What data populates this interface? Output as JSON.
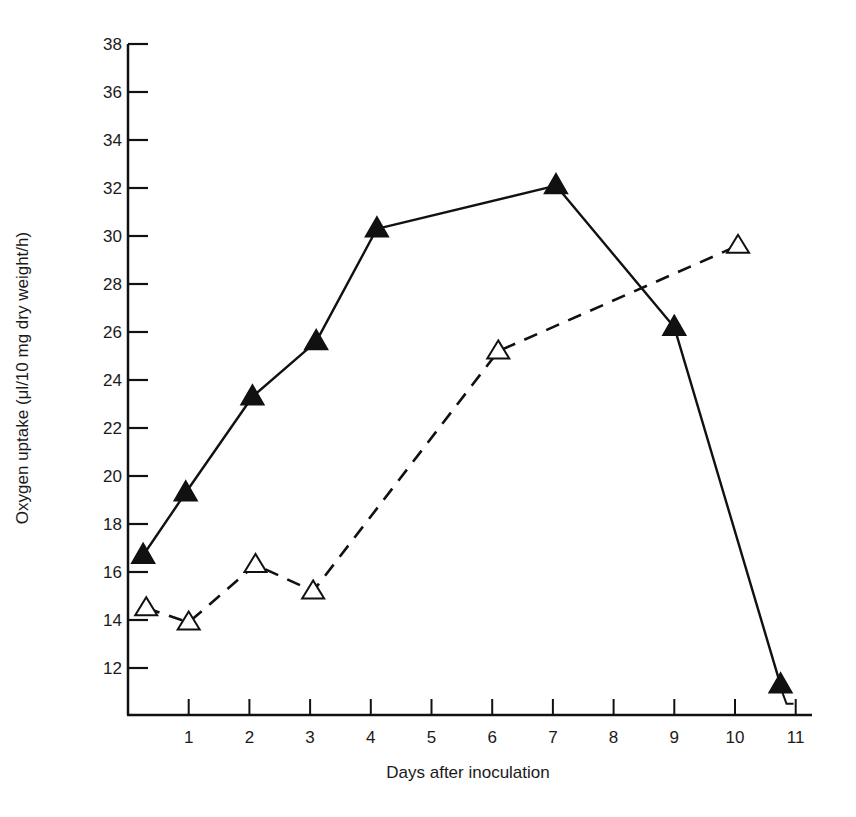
{
  "chart_data": {
    "type": "line",
    "title": "",
    "xlabel": "Days after inoculation",
    "ylabel": "Oxygen uptake (μl/10 mg dry weight/h)",
    "xlim": [
      0,
      11.2
    ],
    "ylim": [
      10.2,
      38
    ],
    "grid": false,
    "legend": null,
    "x_ticks": [
      1,
      2,
      3,
      4,
      5,
      6,
      7,
      8,
      9,
      10,
      11
    ],
    "y_ticks": [
      12,
      14,
      16,
      18,
      20,
      22,
      24,
      26,
      28,
      30,
      32,
      34,
      36,
      38
    ],
    "series": [
      {
        "name": "filled-triangles",
        "marker": "filled-triangle",
        "line_style": "solid",
        "x": [
          0.25,
          0.95,
          2.05,
          3.1,
          4.1,
          7.05,
          9.0,
          10.75
        ],
        "values": [
          16.7,
          19.3,
          23.3,
          25.6,
          30.3,
          32.1,
          26.2,
          11.3
        ]
      },
      {
        "name": "open-triangles",
        "marker": "open-triangle",
        "line_style": "dashed",
        "x": [
          0.3,
          1.0,
          2.1,
          3.05,
          6.1,
          10.05
        ],
        "values": [
          14.5,
          13.9,
          16.3,
          15.2,
          25.2,
          29.6
        ]
      }
    ]
  },
  "layout": {
    "plot_left": 128,
    "plot_bottom": 715,
    "x_axis_end": 812,
    "y_axis_top": 44,
    "px_per_day": 60.7,
    "y_ref_value": 38,
    "y_ref_px": 44,
    "px_per_unit": 24.0,
    "line_color": "#111111"
  }
}
